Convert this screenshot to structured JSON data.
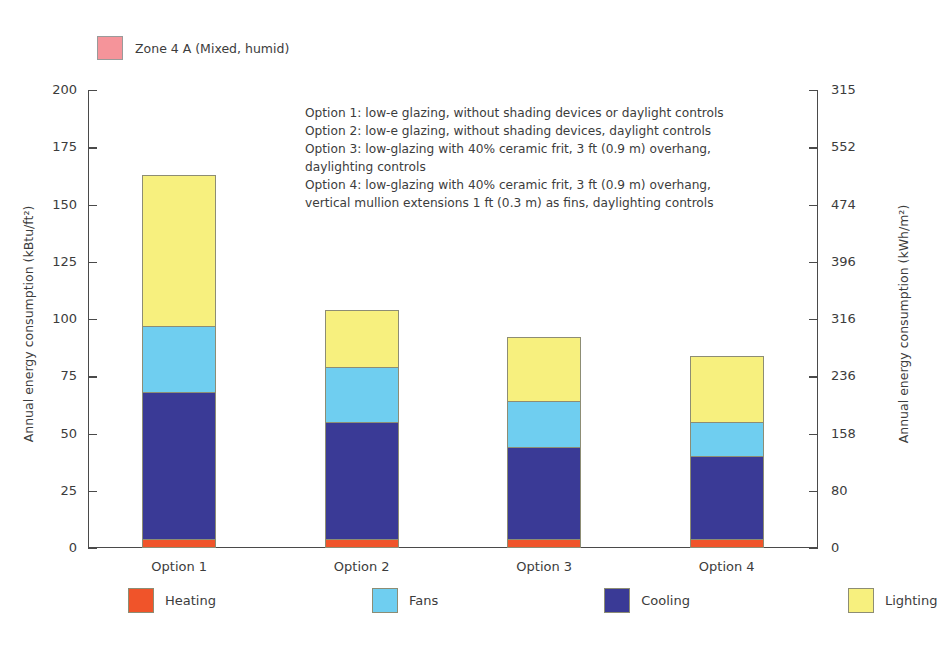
{
  "zone_legend": {
    "label": "Zone 4 A (Mixed, humid)",
    "color": "#f5949a",
    "swatch_name": "zone-color-swatch"
  },
  "annotation": {
    "lines": [
      "Option 1: low-e glazing, without shading devices or daylight controls",
      "Option 2: low-e glazing, without shading devices, daylight controls",
      "Option 3: low-glazing with 40% ceramic frit, 3 ft (0.9 m) overhang,",
      "daylighting controls",
      "Option 4: low-glazing with 40% ceramic frit, 3 ft (0.9 m) overhang,",
      "vertical mullion extensions 1 ft (0.3 m) as fins, daylighting controls"
    ]
  },
  "chart_data": {
    "type": "bar",
    "stacked": true,
    "title": "",
    "xlabel": "",
    "ylabel": "Annual energy consumption (kBtu/ft²)",
    "ylabel_secondary": "Annual energy consumption (kWh/m²)",
    "categories": [
      "Option 1",
      "Option 2",
      "Option 3",
      "Option 4"
    ],
    "ylim": [
      0,
      200
    ],
    "yticks": [
      0,
      25,
      50,
      75,
      100,
      125,
      150,
      175,
      200
    ],
    "yticks_secondary": [
      0,
      80,
      158,
      236,
      316,
      396,
      474,
      552,
      315
    ],
    "grid": false,
    "legend_position": "bottom",
    "series": [
      {
        "name": "Heating",
        "color": "#f0542a",
        "values": [
          4,
          4,
          4,
          4
        ]
      },
      {
        "name": "Cooling",
        "color": "#3a3a96",
        "values": [
          64,
          51,
          40,
          36
        ]
      },
      {
        "name": "Fans",
        "color": "#6fcef0",
        "values": [
          29,
          24,
          20,
          15
        ]
      },
      {
        "name": "Lighting",
        "color": "#f7f07e",
        "values": [
          66,
          25,
          28,
          29
        ]
      }
    ],
    "totals": [
      163,
      104,
      92,
      84
    ]
  },
  "series_legend": [
    {
      "name": "Heating",
      "color": "#f0542a"
    },
    {
      "name": "Fans",
      "color": "#6fcef0"
    },
    {
      "name": "Cooling",
      "color": "#3a3a96"
    },
    {
      "name": "Lighting",
      "color": "#f7f07e"
    }
  ]
}
